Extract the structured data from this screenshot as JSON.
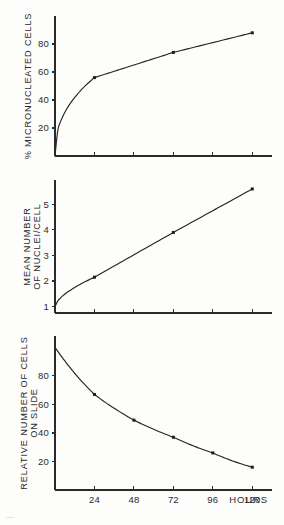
{
  "figure": {
    "background_color": "#fdfdfb",
    "ink_color": "#262626",
    "x_axis": {
      "label": "HOURS",
      "ticks": [
        24,
        48,
        72,
        96,
        120
      ],
      "tick_labels": [
        "24",
        "48",
        "72",
        "96",
        "120"
      ],
      "range": [
        0,
        132
      ]
    },
    "partial_caption": "—"
  },
  "chart_data": [
    {
      "type": "line",
      "title": "% MICRONUCLEATED CELLS",
      "ylabel": "% MICRONUCLEATED CELLS",
      "xlabel": "HOURS",
      "grid": false,
      "legend": "none",
      "xlim": [
        0,
        132
      ],
      "ylim": [
        0,
        100
      ],
      "ytick_labels": [
        "20",
        "40",
        "60",
        "80"
      ],
      "yticks": [
        20,
        40,
        60,
        80
      ],
      "x": [
        0,
        24,
        72,
        120
      ],
      "values": [
        0,
        56,
        74,
        88
      ],
      "markers_at": [
        24,
        72,
        120
      ],
      "panel": "top"
    },
    {
      "type": "line",
      "title": "MEAN NUMBER OF NUCLEI/CELL",
      "ylabel_lines": [
        "MEAN NUMBER",
        "OF NUCLEI/CELL"
      ],
      "ylabel": "MEAN NUMBER OF NUCLEI/CELL",
      "xlabel": "HOURS",
      "grid": false,
      "legend": "none",
      "xlim": [
        0,
        132
      ],
      "ylim": [
        0.75,
        5.95
      ],
      "ytick_labels": [
        "1",
        "2",
        "3",
        "4",
        "5"
      ],
      "yticks": [
        1,
        2,
        3,
        4,
        5
      ],
      "x": [
        0,
        24,
        72,
        120
      ],
      "values": [
        1,
        2.15,
        3.9,
        5.6
      ],
      "markers_at": [
        24,
        72,
        120
      ],
      "panel": "middle"
    },
    {
      "type": "line",
      "title": "RELATIVE NUMBER OF CELLS ON SLIDE",
      "ylabel_lines": [
        "RELATIVE NUMBER OF CELLS",
        "ON SLIDE"
      ],
      "ylabel": "RELATIVE NUMBER OF CELLS ON SLIDE",
      "xlabel": "HOURS",
      "grid": false,
      "legend": "none",
      "xlim": [
        0,
        132
      ],
      "ylim": [
        0,
        108
      ],
      "ytick_labels": [
        "20",
        "40",
        "60",
        "80"
      ],
      "yticks": [
        20,
        40,
        60,
        80
      ],
      "x": [
        0,
        24,
        48,
        72,
        96,
        120
      ],
      "values": [
        100,
        67,
        49,
        37,
        26,
        16
      ],
      "markers_at": [
        24,
        48,
        72,
        96,
        120
      ],
      "panel": "bottom"
    }
  ]
}
